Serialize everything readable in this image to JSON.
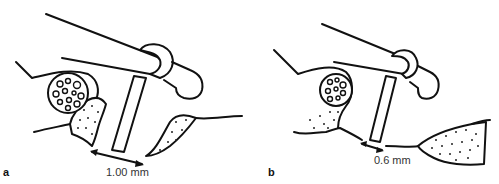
{
  "figure": {
    "panels": [
      {
        "id": "a",
        "label": "a",
        "measurement": "1.00 mm"
      },
      {
        "id": "b",
        "label": "b",
        "measurement": "0.6 mm"
      }
    ]
  },
  "colors": {
    "line": "#111111",
    "background": "#ffffff",
    "text": "#333333"
  }
}
